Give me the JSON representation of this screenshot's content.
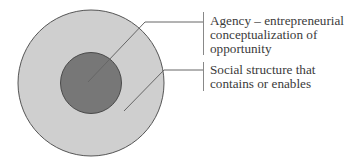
{
  "diagram": {
    "type": "nested-circles",
    "colors": {
      "outer_fill": "#cfcfcf",
      "inner_fill": "#777777",
      "stroke": "#555555",
      "leader": "#666666",
      "text": "#3a3a3a"
    },
    "labels": {
      "agency": {
        "lines": [
          "Agency – entrepreneurial",
          "conceptualization of",
          "opportunity"
        ]
      },
      "social_structure": {
        "lines": [
          "Social structure that",
          "contains or enables"
        ]
      }
    }
  }
}
